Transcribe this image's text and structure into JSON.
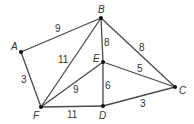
{
  "graph": {
    "type": "weighted-undirected-graph",
    "nodes": [
      {
        "id": "A",
        "label": "A"
      },
      {
        "id": "B",
        "label": "B"
      },
      {
        "id": "C",
        "label": "C"
      },
      {
        "id": "D",
        "label": "D"
      },
      {
        "id": "E",
        "label": "E"
      },
      {
        "id": "F",
        "label": "F"
      }
    ],
    "edges": [
      {
        "from": "A",
        "to": "B",
        "weight": "9"
      },
      {
        "from": "A",
        "to": "F",
        "weight": "3"
      },
      {
        "from": "F",
        "to": "B",
        "weight": "11"
      },
      {
        "from": "B",
        "to": "E",
        "weight": "8"
      },
      {
        "from": "B",
        "to": "C",
        "weight": "8"
      },
      {
        "from": "E",
        "to": "C",
        "weight": "5"
      },
      {
        "from": "F",
        "to": "E",
        "weight": "9"
      },
      {
        "from": "E",
        "to": "D",
        "weight": "6"
      },
      {
        "from": "F",
        "to": "D",
        "weight": "11"
      },
      {
        "from": "D",
        "to": "C",
        "weight": "3"
      }
    ]
  }
}
